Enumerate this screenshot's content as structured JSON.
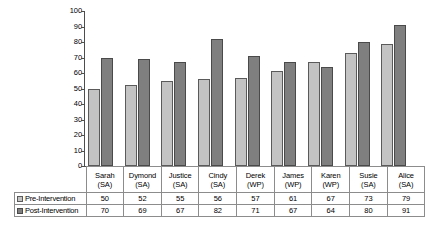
{
  "chart_data": {
    "type": "bar",
    "title": "",
    "xlabel": "",
    "ylabel": "",
    "ylim": [
      0,
      100
    ],
    "yticks": [
      0,
      10,
      20,
      30,
      40,
      50,
      60,
      70,
      80,
      90,
      100
    ],
    "grid": false,
    "legend_position": "table-left",
    "categories": [
      "Sarah (SA)",
      "Dymond (SA)",
      "Justice (SA)",
      "Cindy (SA)",
      "Derek (WP)",
      "James (WP)",
      "Karen (WP)",
      "Susie (SA)",
      "Alice (SA)"
    ],
    "category_names": [
      "Sarah",
      "Dymond",
      "Justice",
      "Cindy",
      "Derek",
      "James",
      "Karen",
      "Susie",
      "Alice"
    ],
    "category_sites": [
      "(SA)",
      "(SA)",
      "(SA)",
      "(SA)",
      "(WP)",
      "(WP)",
      "(WP)",
      "(SA)",
      "(SA)"
    ],
    "series": [
      {
        "name": "Pre-Intervention",
        "color": "#c3c3c3",
        "values": [
          50,
          52,
          55,
          56,
          57,
          61,
          67,
          73,
          79
        ]
      },
      {
        "name": "Post-Intervention",
        "color": "#7f7f7f",
        "values": [
          70,
          69,
          67,
          82,
          71,
          67,
          64,
          80,
          91
        ]
      }
    ]
  },
  "colors": {
    "pre_fill": "#c3c3c3",
    "post_fill": "#7f7f7f",
    "bar_outline": "#5a5a5a",
    "axis": "#4d4d4d",
    "table_border": "#8c8c8c",
    "text": "#000000",
    "background": "#ffffff"
  }
}
